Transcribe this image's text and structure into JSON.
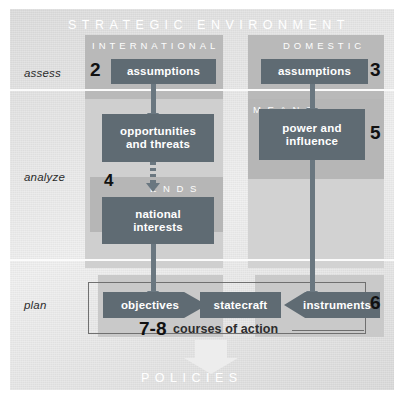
{
  "diagram": {
    "title": "STRATEGIC ENVIRONMENT",
    "footer": "POLICIES",
    "stages": [
      {
        "key": "assess",
        "label": "assess"
      },
      {
        "key": "analyze",
        "label": "analyze"
      },
      {
        "key": "plan",
        "label": "plan"
      }
    ],
    "section_headings": {
      "international": "INTERNATIONAL",
      "domestic": "DOMESTIC",
      "ends": "E N D S",
      "means": "M E A N S"
    },
    "nodes": {
      "intl_assumptions": "assumptions",
      "dom_assumptions": "assumptions",
      "opportunities": "opportunities\nand threats",
      "opportunities_line1": "opportunities",
      "opportunities_line2": "and threats",
      "power": "power and\ninfluence",
      "power_line1": "power and",
      "power_line2": "influence",
      "national_interests_line1": "national",
      "national_interests_line2": "interests",
      "objectives": "objectives",
      "statecraft": "statecraft",
      "instruments": "instruments"
    },
    "step_numbers": {
      "intl_assumptions": "2",
      "dom_assumptions": "3",
      "national_interests": "4",
      "power": "5",
      "instruments": "6",
      "courses_of_action": "7-8"
    },
    "courses_of_action_label": "courses of action",
    "colors": {
      "node_fill": "#5f6b73",
      "node_text": "#ffffff",
      "panel_bg": "#e6e6e6",
      "band_shade": "#b9b9b9",
      "connector": "#6a7780",
      "number_text": "#111111"
    }
  }
}
